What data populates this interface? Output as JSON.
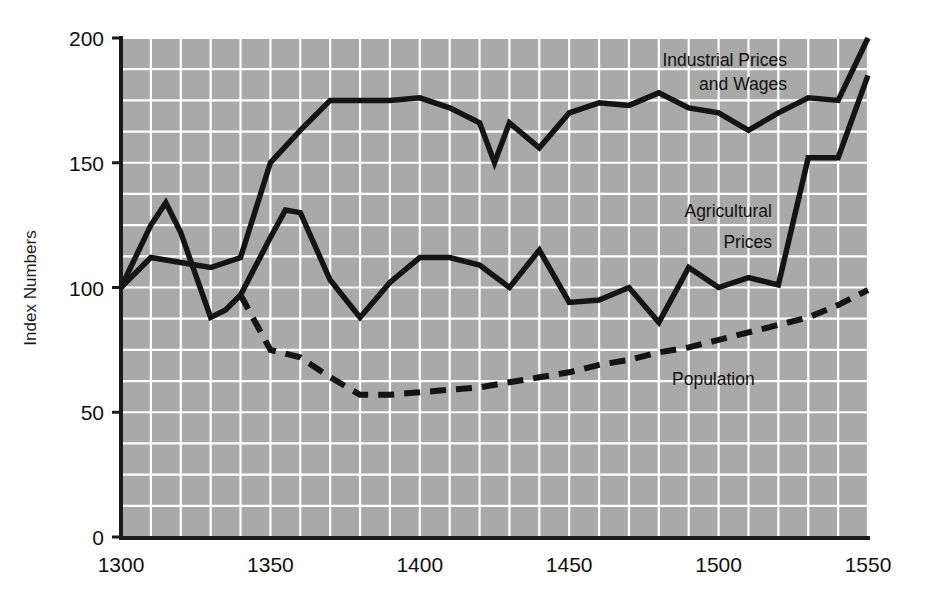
{
  "chart_data": {
    "type": "line",
    "title": "",
    "xlabel": "",
    "ylabel": "Index Numbers",
    "xlim": [
      1300,
      1550
    ],
    "ylim": [
      0,
      200
    ],
    "xticks": [
      1300,
      1350,
      1400,
      1450,
      1500,
      1550
    ],
    "yticks": [
      0,
      50,
      100,
      150,
      200
    ],
    "grid": true,
    "grid_x_step": 10,
    "grid_y_step": 12.5,
    "legend_position": "inline-annotations",
    "series": [
      {
        "name": "Industrial Prices and Wages",
        "style": "solid",
        "annotation": [
          "Industrial Prices",
          "and Wages"
        ],
        "x": [
          1300,
          1310,
          1320,
          1330,
          1340,
          1350,
          1360,
          1370,
          1380,
          1390,
          1400,
          1410,
          1420,
          1425,
          1430,
          1440,
          1450,
          1460,
          1470,
          1480,
          1490,
          1500,
          1510,
          1520,
          1530,
          1540,
          1550
        ],
        "y": [
          100,
          112,
          110,
          108,
          112,
          150,
          163,
          175,
          175,
          175,
          176,
          172,
          166,
          150,
          166,
          156,
          170,
          174,
          173,
          178,
          172,
          170,
          163,
          170,
          176,
          175,
          200
        ]
      },
      {
        "name": "Agricultural Prices",
        "style": "solid",
        "annotation": [
          "Agricultural",
          "Prices"
        ],
        "x": [
          1300,
          1310,
          1315,
          1320,
          1330,
          1335,
          1340,
          1350,
          1355,
          1360,
          1370,
          1380,
          1390,
          1400,
          1410,
          1420,
          1430,
          1440,
          1450,
          1460,
          1470,
          1480,
          1490,
          1500,
          1510,
          1520,
          1530,
          1540,
          1550
        ],
        "y": [
          100,
          125,
          134,
          122,
          88,
          91,
          97,
          120,
          131,
          130,
          103,
          88,
          102,
          112,
          112,
          109,
          100,
          115,
          94,
          95,
          100,
          86,
          108,
          100,
          104,
          101,
          152,
          152,
          185
        ]
      },
      {
        "name": "Population",
        "style": "dashed",
        "annotation": [
          "Population"
        ],
        "x": [
          1340,
          1350,
          1360,
          1370,
          1380,
          1390,
          1400,
          1410,
          1420,
          1430,
          1440,
          1450,
          1460,
          1470,
          1480,
          1490,
          1500,
          1510,
          1520,
          1530,
          1540,
          1550
        ],
        "y": [
          97,
          75,
          72,
          64,
          57,
          57,
          58,
          59,
          60,
          62,
          64,
          66,
          69,
          71,
          74,
          76,
          79,
          82,
          85,
          88,
          93,
          99
        ]
      }
    ],
    "colors": {
      "plot_background": "#a9a9a9",
      "gridline": "#ffffff",
      "axis": "#1a1a1a",
      "line": "#141414",
      "page_background": "#ffffff"
    }
  }
}
